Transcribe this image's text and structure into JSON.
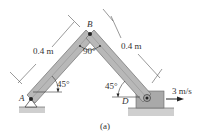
{
  "figure": {
    "caption": "(a)",
    "points": {
      "A": "A",
      "B": "B",
      "D": "D"
    },
    "dimensions": {
      "left_length": "0.4 m",
      "right_length": "0.4 m"
    },
    "angles": {
      "at_B": "90°",
      "at_A": "45°",
      "at_D": "45°"
    },
    "velocity": {
      "label": "3 m/s",
      "direction": "right"
    },
    "colors": {
      "link_fill": "#b8b8b8",
      "link_edge": "#6e6e6e",
      "block_fill": "#a9a9a9",
      "ground_fill": "#cfcfcf",
      "line": "#333333"
    }
  }
}
